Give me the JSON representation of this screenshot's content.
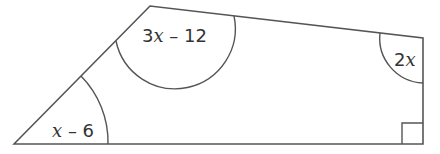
{
  "diagram": {
    "shape": "quadrilateral",
    "stroke_color": "#555555",
    "vertices": {
      "bottom_left": [
        14,
        144
      ],
      "top_left": [
        150,
        6
      ],
      "top_right": [
        423,
        38
      ],
      "bottom_right": [
        423,
        144
      ]
    },
    "angles": {
      "bottom_left": {
        "coef": "",
        "var": "x",
        "rest": " – 6"
      },
      "top_left": {
        "coef": "3",
        "var": "x",
        "rest": " – 12"
      },
      "top_right": {
        "coef": "2",
        "var": "x",
        "rest": ""
      },
      "bottom_right": {
        "marker": "right-angle"
      }
    }
  }
}
